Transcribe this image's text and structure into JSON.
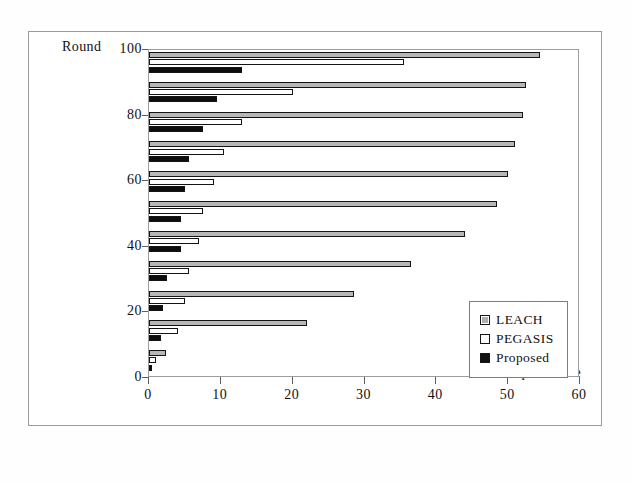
{
  "chart_data": {
    "type": "bar",
    "orientation": "horizontal",
    "title": "",
    "xlabel": "HopDistance",
    "ylabel": "Round",
    "xlim": [
      0,
      60
    ],
    "ylim": [
      0,
      100
    ],
    "xticks": [
      0,
      10,
      20,
      30,
      40,
      50,
      60
    ],
    "yticks": [
      0,
      20,
      40,
      60,
      80,
      100
    ],
    "xtick_labels": [
      "0",
      "10",
      "20",
      "30",
      "40",
      "50",
      "60"
    ],
    "ytick_labels": [
      "0",
      "20",
      "40",
      "60",
      "80",
      "100"
    ],
    "grid": false,
    "legend_position": "lower-right",
    "categories": [
      0,
      10,
      20,
      30,
      40,
      50,
      60,
      70,
      80,
      90,
      100
    ],
    "series": [
      {
        "name": "LEACH",
        "color": "#b7b7b7",
        "values": [
          2.3,
          22.0,
          28.5,
          36.5,
          44.0,
          48.5,
          50.0,
          51.0,
          52.0,
          52.5,
          54.5
        ]
      },
      {
        "name": "PEGASIS",
        "color": "#ffffff",
        "values": [
          1.0,
          4.0,
          5.0,
          5.5,
          7.0,
          7.5,
          9.0,
          10.5,
          13.0,
          20.0,
          35.5
        ]
      },
      {
        "name": "Proposed",
        "color": "#0d0d0d",
        "values": [
          0.4,
          1.7,
          2.0,
          2.5,
          4.5,
          4.5,
          5.0,
          5.5,
          7.5,
          9.5,
          13.0
        ]
      }
    ]
  },
  "legend": {
    "items": [
      {
        "label": "LEACH",
        "swatch": "leach"
      },
      {
        "label": "PEGASIS",
        "swatch": "pegasis"
      },
      {
        "label": "Proposed",
        "swatch": "proposed"
      }
    ]
  },
  "axes": {
    "y_title": "Round",
    "x_title": "HopDistance"
  },
  "colors": {
    "leach": "#b7b7b7",
    "pegasis": "#ffffff",
    "proposed": "#0d0d0d",
    "frame": "#9a9a9a",
    "axis": "#5e5e5e"
  }
}
